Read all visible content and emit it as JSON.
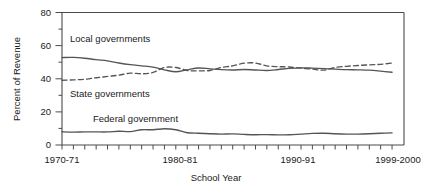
{
  "chart_data": {
    "type": "line",
    "title": "",
    "xlabel": "School Year",
    "ylabel": "Percent of Revenue",
    "ylim": [
      0,
      80
    ],
    "yticks": [
      0,
      20,
      40,
      60,
      80
    ],
    "yticklabels": [
      "0",
      "20",
      "40",
      "60",
      "80"
    ],
    "y_minor_tick_step": 10,
    "grid": false,
    "legend": "inline-annotations",
    "x": [
      "1970-71",
      "1971-72",
      "1972-73",
      "1973-74",
      "1974-75",
      "1975-76",
      "1976-77",
      "1977-78",
      "1978-79",
      "1979-80",
      "1980-81",
      "1981-82",
      "1982-83",
      "1983-84",
      "1984-85",
      "1985-86",
      "1986-87",
      "1987-88",
      "1988-89",
      "1989-90",
      "1990-91",
      "1991-92",
      "1992-93",
      "1993-94",
      "1994-95",
      "1995-96",
      "1996-97",
      "1997-98",
      "1998-99",
      "1999-2000"
    ],
    "xticklabels_shown": [
      "1970-71",
      "1980-81",
      "1990-91",
      "1999-2000"
    ],
    "xticklabel_positions": [
      0,
      10,
      20,
      29
    ],
    "series": [
      {
        "name": "Local governments",
        "style": "solid",
        "label_text": "Local governments",
        "values": [
          52.8,
          52.9,
          52.4,
          51.5,
          50.8,
          49.5,
          48.5,
          47.8,
          47.0,
          45.4,
          44.2,
          45.4,
          46.5,
          46.0,
          45.5,
          45.3,
          45.6,
          45.3,
          45.0,
          45.6,
          46.3,
          46.6,
          46.4,
          46.1,
          45.8,
          45.5,
          45.4,
          45.2,
          44.6,
          43.9
        ]
      },
      {
        "name": "State governments",
        "style": "dashed",
        "label_text": "State governments",
        "values": [
          39.1,
          39.3,
          39.7,
          40.6,
          41.4,
          42.2,
          43.4,
          43.0,
          43.8,
          46.8,
          46.8,
          45.0,
          44.8,
          45.0,
          46.8,
          47.8,
          49.4,
          49.5,
          47.8,
          47.3,
          47.1,
          46.4,
          45.8,
          45.2,
          46.8,
          47.5,
          48.0,
          48.4,
          48.7,
          49.5
        ]
      },
      {
        "name": "Federal government",
        "style": "solid",
        "label_text": "Federal government",
        "values": [
          8.0,
          7.8,
          7.9,
          7.9,
          7.9,
          8.3,
          8.1,
          9.2,
          9.2,
          9.8,
          9.2,
          7.4,
          7.1,
          6.8,
          6.6,
          6.7,
          6.4,
          6.2,
          6.3,
          6.1,
          6.2,
          6.6,
          7.0,
          7.1,
          6.8,
          6.6,
          6.6,
          6.8,
          7.1,
          7.3
        ]
      }
    ]
  },
  "annotations": {
    "local_label": "Local governments",
    "state_label": "State governments",
    "federal_label": "Federal government"
  },
  "colors": {
    "line": "#555555",
    "axis": "#4a4a4a",
    "text": "#1a1a1a",
    "background": "#ffffff"
  }
}
